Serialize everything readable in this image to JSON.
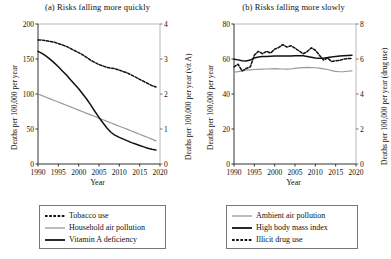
{
  "figure": {
    "xlabel": "Year",
    "x_ticks": [
      1990,
      1995,
      2000,
      2005,
      2010,
      2015,
      2020
    ]
  },
  "panel_a": {
    "title": "(a) Risks falling more quickly",
    "ylabel_left": "Deaths per 100,000 per year",
    "ylabel_right": "Deaths per 100,000 per year (vit A)",
    "y_ticks_left": [
      0,
      50,
      100,
      150,
      200
    ],
    "y_ticks_right": [
      0,
      1,
      2,
      3,
      4
    ],
    "legend": [
      {
        "label": "Tobacco use",
        "style": "dashed",
        "color": "#111111"
      },
      {
        "label": "Household air pollution",
        "style": "solid",
        "color": "#9a9a9a"
      },
      {
        "label": "Vitamin A deficiency",
        "style": "solid",
        "color": "#111111"
      }
    ]
  },
  "panel_b": {
    "title": "(b) Risks falling more slowly",
    "ylabel_left": "Deaths per 100,000 per year",
    "ylabel_right": "Deaths per 100,000 per year (drug use)",
    "y_ticks_left": [
      0,
      20,
      40,
      60,
      80
    ],
    "y_ticks_right": [
      0,
      2,
      4,
      6,
      8
    ],
    "legend": [
      {
        "label": "Ambient air pollution",
        "style": "solid",
        "color": "#9a9a9a"
      },
      {
        "label": "High body mass index",
        "style": "solid",
        "color": "#111111"
      },
      {
        "label": "Illicit drug use",
        "style": "dashed",
        "color": "#111111"
      }
    ]
  },
  "chart_data": [
    {
      "type": "line",
      "panel": "a",
      "title": "(a) Risks falling more quickly",
      "xlabel": "Year",
      "ylabel": "Deaths per 100,000 per year",
      "ylabel_secondary": "Deaths per 100,000 per year (vit A)",
      "xlim": [
        1990,
        2020
      ],
      "ylim": [
        0,
        200
      ],
      "ylim_secondary": [
        0,
        4
      ],
      "grid": false,
      "legend_position": "below",
      "x": [
        1990,
        1991,
        1992,
        1993,
        1994,
        1995,
        1996,
        1997,
        1998,
        1999,
        2000,
        2001,
        2002,
        2003,
        2004,
        2005,
        2006,
        2007,
        2008,
        2009,
        2010,
        2011,
        2012,
        2013,
        2014,
        2015,
        2016,
        2017,
        2018,
        2019
      ],
      "series": [
        {
          "name": "Tobacco use",
          "axis": "left",
          "style": "dashed",
          "color": "#111111",
          "values": [
            177,
            177,
            176,
            175,
            174,
            172,
            170,
            168,
            165,
            162,
            159,
            156,
            152,
            148,
            145,
            142,
            140,
            138,
            137,
            136,
            134,
            132,
            130,
            127,
            124,
            121,
            118,
            115,
            112,
            110
          ]
        },
        {
          "name": "Household air pollution",
          "axis": "left",
          "style": "solid",
          "color": "#9a9a9a",
          "values": [
            100,
            97.7,
            95.4,
            93.1,
            90.8,
            88.5,
            86.2,
            83.9,
            81.6,
            79.3,
            77,
            74.7,
            72.4,
            70.1,
            67.8,
            65.5,
            63.2,
            60.9,
            58.6,
            56.3,
            54,
            51.7,
            49.4,
            47.1,
            44.8,
            42.5,
            40.2,
            37.9,
            35.6,
            33
          ]
        },
        {
          "name": "Vitamin A deficiency",
          "axis": "right",
          "style": "solid",
          "color": "#111111",
          "values": [
            3.22,
            3.16,
            3.08,
            2.99,
            2.89,
            2.78,
            2.66,
            2.54,
            2.41,
            2.28,
            2.15,
            2.0,
            1.85,
            1.68,
            1.5,
            1.33,
            1.17,
            1.02,
            0.9,
            0.82,
            0.76,
            0.71,
            0.66,
            0.61,
            0.57,
            0.53,
            0.49,
            0.45,
            0.42,
            0.4
          ]
        }
      ]
    },
    {
      "type": "line",
      "panel": "b",
      "title": "(b) Risks falling more slowly",
      "xlabel": "Year",
      "ylabel": "Deaths per 100,000 per year",
      "ylabel_secondary": "Deaths per 100,000 per year (drug use)",
      "xlim": [
        1990,
        2020
      ],
      "ylim": [
        0,
        80
      ],
      "ylim_secondary": [
        0,
        8
      ],
      "grid": false,
      "legend_position": "below",
      "x": [
        1990,
        1991,
        1992,
        1993,
        1994,
        1995,
        1996,
        1997,
        1998,
        1999,
        2000,
        2001,
        2002,
        2003,
        2004,
        2005,
        2006,
        2007,
        2008,
        2009,
        2010,
        2011,
        2012,
        2013,
        2014,
        2015,
        2016,
        2017,
        2018,
        2019
      ],
      "series": [
        {
          "name": "Ambient air pollution",
          "axis": "left",
          "style": "solid",
          "color": "#9a9a9a",
          "values": [
            52.5,
            52.8,
            53.2,
            53.6,
            53.8,
            54.0,
            54.1,
            54.2,
            54.3,
            54.4,
            54.5,
            54.4,
            54.3,
            54.2,
            54.3,
            54.6,
            54.9,
            55.1,
            55.2,
            55.1,
            55.0,
            54.8,
            54.4,
            54.0,
            53.4,
            52.9,
            52.7,
            52.8,
            53.0,
            53.2
          ]
        },
        {
          "name": "High body mass index",
          "axis": "left",
          "style": "solid",
          "color": "#111111",
          "values": [
            59.8,
            59.5,
            59.0,
            58.8,
            59.4,
            60.6,
            61.2,
            61.4,
            61.5,
            61.6,
            61.7,
            61.7,
            61.7,
            61.7,
            61.7,
            61.8,
            61.9,
            61.8,
            61.4,
            61.0,
            60.6,
            60.4,
            60.5,
            60.8,
            61.2,
            61.5,
            61.7,
            61.9,
            62.0,
            62.1
          ]
        },
        {
          "name": "Illicit drug use",
          "axis": "right",
          "style": "dashed",
          "color": "#111111",
          "values": [
            5.55,
            5.7,
            5.32,
            5.46,
            5.55,
            6.22,
            6.44,
            6.3,
            6.44,
            6.34,
            6.56,
            6.66,
            6.82,
            6.68,
            6.76,
            6.62,
            6.46,
            6.3,
            6.42,
            6.64,
            6.5,
            6.22,
            5.94,
            6.06,
            5.86,
            5.9,
            5.92,
            6.0,
            6.02,
            6.04
          ]
        }
      ]
    }
  ]
}
